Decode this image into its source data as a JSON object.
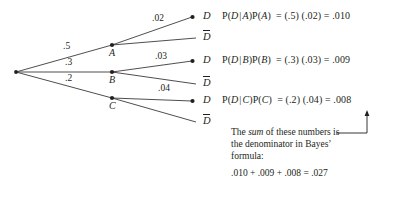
{
  "diagram": {
    "line_color": "#231f20",
    "background": "#ffffff"
  },
  "tree": {
    "root": {
      "x": 16,
      "y": 72
    },
    "branches": [
      {
        "node_label": "A",
        "prior_prob": ".5",
        "node": {
          "x": 112,
          "y": 45
        },
        "prior_label_pos": {
          "x": 63,
          "y": 42
        },
        "cond_prob": ".02",
        "cond_label_pos": {
          "x": 152,
          "y": 14
        },
        "outcome": "D",
        "outcome_pos": {
          "x": 203,
          "y": 11
        },
        "complement": "D",
        "complement_pos": {
          "x": 203,
          "y": 32
        }
      },
      {
        "node_label": "B",
        "prior_prob": ".3",
        "node": {
          "x": 112,
          "y": 72
        },
        "prior_label_pos": {
          "x": 65,
          "y": 58
        },
        "cond_prob": ".03",
        "cond_label_pos": {
          "x": 155,
          "y": 52
        },
        "outcome": "D",
        "outcome_pos": {
          "x": 203,
          "y": 55
        },
        "complement": "D",
        "complement_pos": {
          "x": 203,
          "y": 78
        }
      },
      {
        "node_label": "C",
        "prior_prob": ".2",
        "node": {
          "x": 112,
          "y": 98
        },
        "prior_label_pos": {
          "x": 65,
          "y": 74
        },
        "cond_prob": ".04",
        "cond_label_pos": {
          "x": 158,
          "y": 84
        },
        "outcome": "D",
        "outcome_pos": {
          "x": 203,
          "y": 95
        },
        "complement": "D",
        "complement_pos": {
          "x": 203,
          "y": 116
        }
      }
    ]
  },
  "equations": [
    {
      "lhs_prefix": "P(",
      "lhs_num": "D",
      "lhs_bar": "|",
      "lhs_den": "A",
      "lhs_close": ")P(",
      "lhs_event": "A",
      "lhs_end": ")",
      "eq1": "=",
      "factor1": "(.5)",
      "factor2": "(.02)",
      "eq2": "=",
      "result": ".010",
      "pos": {
        "x": 222,
        "y": 10
      }
    },
    {
      "lhs_prefix": "P(",
      "lhs_num": "D",
      "lhs_bar": "|",
      "lhs_den": "B",
      "lhs_close": ")P(",
      "lhs_event": "B",
      "lhs_end": ")",
      "eq1": "=",
      "factor1": "(.3)",
      "factor2": "(.03)",
      "eq2": "=",
      "result": ".009",
      "pos": {
        "x": 222,
        "y": 54
      }
    },
    {
      "lhs_prefix": "P(",
      "lhs_num": "D",
      "lhs_bar": "|",
      "lhs_den": "C",
      "lhs_close": ")P(",
      "lhs_event": "C",
      "lhs_end": ")",
      "eq1": "=",
      "factor1": "(.2)",
      "factor2": "(.04)",
      "eq2": "=",
      "result": ".008",
      "pos": {
        "x": 222,
        "y": 94
      }
    }
  ],
  "annotation": {
    "line1_a": "The ",
    "line1_em": "sum",
    "line1_b": " of these numbers is",
    "line2": "the denominator in Bayes’",
    "line3": "formula:",
    "pos": {
      "x": 231,
      "y": 126
    },
    "sum_line": ".010  +  .009  +  .008  =  .027",
    "sum_pos": {
      "x": 231,
      "y": 168
    }
  }
}
